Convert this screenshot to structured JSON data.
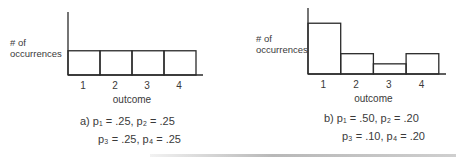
{
  "chart_data": [
    {
      "type": "bar",
      "panel": "a",
      "categories": [
        "1",
        "2",
        "3",
        "4"
      ],
      "values": [
        0.25,
        0.25,
        0.25,
        0.25
      ],
      "xlabel": "outcome",
      "ylabel_lines": [
        "# of",
        "occurrences"
      ],
      "ylim": [
        0,
        0.65
      ],
      "grid": false,
      "caption_lines": [
        "a)  p₁ = .25,  p₂ = .25",
        "p₃ = .25,  p₄ = .25"
      ]
    },
    {
      "type": "bar",
      "panel": "b",
      "categories": [
        "1",
        "2",
        "3",
        "4"
      ],
      "values": [
        0.5,
        0.2,
        0.1,
        0.2
      ],
      "xlabel": "outcome",
      "ylabel_lines": [
        "# of",
        "occurrences"
      ],
      "ylim": [
        0,
        0.65
      ],
      "grid": false,
      "caption_lines": [
        "b)  p₁ = .50,  p₂ = .20",
        "p₃ = .10,  p₄ = .20"
      ]
    }
  ]
}
